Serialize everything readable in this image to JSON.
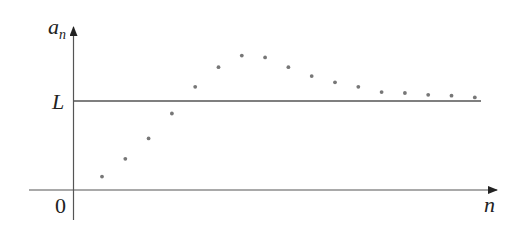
{
  "chart_data": {
    "type": "scatter",
    "title": "",
    "xlabel": "n",
    "ylabel": "a_n",
    "ylabel_main": "a",
    "ylabel_sub": "n",
    "origin_label": "0",
    "reference_line": {
      "label": "L",
      "description": "horizontal limit line y = L"
    },
    "grid": false,
    "legend": null,
    "x": [
      1,
      2,
      3,
      4,
      5,
      6,
      7,
      8,
      9,
      10,
      11,
      12,
      13,
      14,
      15,
      16,
      17
    ],
    "values_relative_to_L": [
      -0.85,
      -0.65,
      -0.42,
      -0.14,
      0.16,
      0.38,
      0.51,
      0.49,
      0.38,
      0.28,
      0.21,
      0.16,
      0.1,
      0.09,
      0.07,
      0.06,
      0.04
    ],
    "note": "Sequence a_n rises from near 0, overshoots L, then approaches L from above",
    "colors": {
      "axis": "#555555",
      "points": "#777777",
      "text": "#222222"
    }
  }
}
